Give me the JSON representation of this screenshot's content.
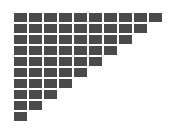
{
  "figure": {
    "type": "grid-pattern",
    "background_color": "#ffffff",
    "block_color": "#4a4a4a",
    "canvas": {
      "width": 182,
      "height": 130
    }
  },
  "chart_data": {
    "type": "bar",
    "title": "",
    "subtitle": "",
    "xlabel": "",
    "ylabel": "",
    "grid": false,
    "legend_position": "none",
    "orientation": "horizontal",
    "categories": [
      "row-1",
      "row-2",
      "row-3",
      "row-4",
      "row-5",
      "row-6",
      "row-7",
      "row-8",
      "row-9",
      "row-10"
    ],
    "values": [
      10,
      9,
      8,
      7,
      6,
      5,
      4,
      3,
      2,
      1
    ],
    "xlim": [
      0,
      10
    ],
    "ylim": [
      0,
      10
    ],
    "total_blocks": 55,
    "annotations": [],
    "tick_labels": {
      "x": [],
      "y": []
    }
  },
  "geometry": {
    "origin_x": 14,
    "origin_y": 13,
    "block_width": 13,
    "block_height": 9,
    "pitch_x": 15,
    "pitch_y": 11,
    "gap_x": 2,
    "gap_y": 2,
    "rows": 10,
    "max_columns": 10
  },
  "rows": [
    {
      "index": 1,
      "count": 10,
      "label": "row-1"
    },
    {
      "index": 2,
      "count": 9,
      "label": "row-2"
    },
    {
      "index": 3,
      "count": 8,
      "label": "row-3"
    },
    {
      "index": 4,
      "count": 7,
      "label": "row-4"
    },
    {
      "index": 5,
      "count": 6,
      "label": "row-5"
    },
    {
      "index": 6,
      "count": 5,
      "label": "row-6"
    },
    {
      "index": 7,
      "count": 4,
      "label": "row-7"
    },
    {
      "index": 8,
      "count": 3,
      "label": "row-8"
    },
    {
      "index": 9,
      "count": 2,
      "label": "row-9"
    },
    {
      "index": 10,
      "count": 1,
      "label": "row-10"
    }
  ]
}
